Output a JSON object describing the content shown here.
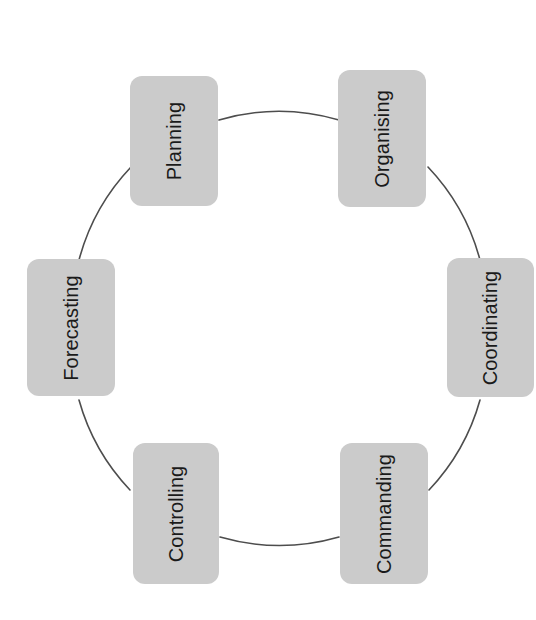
{
  "diagram": {
    "type": "cycle",
    "shape": "circle",
    "node_fill_color": "#cbcbcb",
    "node_text_color": "#1a1a1a",
    "arc_color": "#4d4d4d",
    "background_color": "#ffffff",
    "text_orientation": "rotated-90-ccw",
    "nodes": [
      {
        "id": "planning",
        "label": "Planning",
        "position": "top-left"
      },
      {
        "id": "organising",
        "label": "Organising",
        "position": "top-right"
      },
      {
        "id": "coordinating",
        "label": "Coordinating",
        "position": "right"
      },
      {
        "id": "commanding",
        "label": "Commanding",
        "position": "bottom-right"
      },
      {
        "id": "controlling",
        "label": "Controlling",
        "position": "bottom-left"
      },
      {
        "id": "forecasting",
        "label": "Forecasting",
        "position": "left"
      }
    ],
    "connections": [
      {
        "from": "planning",
        "to": "organising"
      },
      {
        "from": "organising",
        "to": "coordinating"
      },
      {
        "from": "coordinating",
        "to": "commanding"
      },
      {
        "from": "commanding",
        "to": "controlling"
      },
      {
        "from": "controlling",
        "to": "forecasting"
      },
      {
        "from": "forecasting",
        "to": "planning"
      }
    ]
  }
}
